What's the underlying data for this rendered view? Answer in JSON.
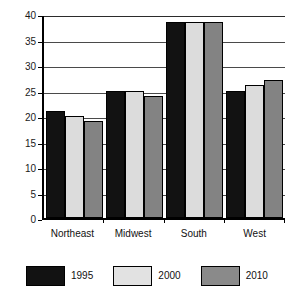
{
  "chart_data": {
    "type": "bar",
    "title": "",
    "xlabel": "",
    "ylabel": "",
    "ylim": [
      0,
      40
    ],
    "yticks": [
      0,
      5,
      10,
      15,
      20,
      25,
      30,
      35,
      40
    ],
    "ytick_labels": [
      "0",
      "5",
      "10",
      "15",
      "20",
      "25",
      "30",
      "35",
      "40"
    ],
    "grid": true,
    "legend_position": "bottom",
    "categories": [
      "Northeast",
      "Midwest",
      "South",
      "West"
    ],
    "series": [
      {
        "name": "1995",
        "color": "#121212",
        "values": [
          21,
          25,
          38.5,
          25
        ]
      },
      {
        "name": "2000",
        "color": "#dcdcdc",
        "values": [
          20,
          25,
          38.5,
          26
        ]
      },
      {
        "name": "2010",
        "color": "#838383",
        "values": [
          19,
          24,
          38.5,
          27
        ]
      }
    ]
  },
  "header": {
    "clipped_text": ""
  }
}
